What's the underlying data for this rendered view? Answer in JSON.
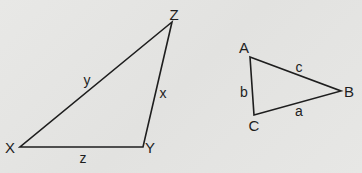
{
  "diagram": {
    "type": "two-triangles",
    "background": "#e5e5e3",
    "line_color": "#1e1e1e",
    "triangles": [
      {
        "name": "XYZ",
        "vertices": [
          {
            "label": "X",
            "x": 20,
            "y": 147,
            "lx": 10,
            "ly": 153
          },
          {
            "label": "Y",
            "x": 143,
            "y": 147,
            "lx": 150,
            "ly": 153
          },
          {
            "label": "Z",
            "x": 172,
            "y": 22,
            "lx": 174,
            "ly": 20
          }
        ],
        "sides": [
          {
            "label": "y",
            "lx": 87,
            "ly": 85
          },
          {
            "label": "x",
            "lx": 163,
            "ly": 98
          },
          {
            "label": "z",
            "lx": 83,
            "ly": 163
          }
        ]
      },
      {
        "name": "ABC",
        "vertices": [
          {
            "label": "A",
            "x": 250,
            "y": 57,
            "lx": 244,
            "ly": 53
          },
          {
            "label": "B",
            "x": 341,
            "y": 91,
            "lx": 349,
            "ly": 97
          },
          {
            "label": "C",
            "x": 254,
            "y": 115,
            "lx": 254,
            "ly": 131
          }
        ],
        "sides": [
          {
            "label": "c",
            "lx": 299,
            "ly": 72
          },
          {
            "label": "b",
            "lx": 244,
            "ly": 97
          },
          {
            "label": "a",
            "lx": 299,
            "ly": 116
          }
        ]
      }
    ]
  }
}
